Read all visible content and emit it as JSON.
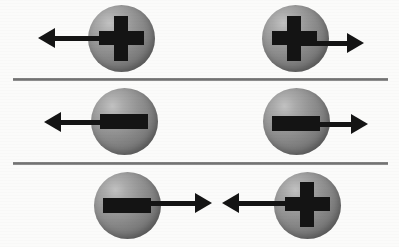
{
  "figure": {
    "background_color": "#fbfbfa",
    "sphere_color": "#848484",
    "sphere_highlight_color": "#c2c2c2",
    "glyph_color": "#141414",
    "arrow_color": "#141414",
    "divider_color": "#7a7a7a",
    "sphere_diameter": 67
  },
  "dividers": [
    {
      "name": "divider-row-1-2",
      "x": 13,
      "y": 78,
      "width": 375
    },
    {
      "name": "divider-row-2-3",
      "x": 13,
      "y": 162,
      "width": 375
    }
  ],
  "rows": [
    {
      "name": "row-positive-diverging",
      "particles": [
        {
          "name": "particle-top-left",
          "charge": "+",
          "charge_label": "positive",
          "arrow_direction": "left",
          "sphere": {
            "cx": 121,
            "cy": 38
          },
          "arrow": {
            "x": 38,
            "y": 38,
            "length": 70
          }
        },
        {
          "name": "particle-top-right",
          "charge": "+",
          "charge_label": "positive",
          "arrow_direction": "right",
          "sphere": {
            "cx": 295,
            "cy": 38
          },
          "arrow": {
            "x": 292,
            "y": 43,
            "length": 72
          }
        }
      ]
    },
    {
      "name": "row-negative-diverging",
      "particles": [
        {
          "name": "particle-middle-left",
          "charge": "-",
          "charge_label": "negative",
          "arrow_direction": "left",
          "sphere": {
            "cx": 124,
            "cy": 121
          },
          "arrow": {
            "x": 44,
            "y": 122,
            "length": 68
          }
        },
        {
          "name": "particle-middle-right",
          "charge": "-",
          "charge_label": "negative",
          "arrow_direction": "right",
          "sphere": {
            "cx": 296,
            "cy": 121
          },
          "arrow": {
            "x": 288,
            "y": 124,
            "length": 80
          }
        }
      ]
    },
    {
      "name": "row-opposite-converging",
      "particles": [
        {
          "name": "particle-bottom-left",
          "charge": "-",
          "charge_label": "negative",
          "arrow_direction": "right",
          "sphere": {
            "cx": 127,
            "cy": 205
          },
          "arrow": {
            "x": 148,
            "y": 203,
            "length": 64
          }
        },
        {
          "name": "particle-bottom-right",
          "charge": "+",
          "charge_label": "positive",
          "arrow_direction": "left",
          "sphere": {
            "cx": 307,
            "cy": 205
          },
          "arrow": {
            "x": 222,
            "y": 203,
            "length": 66
          }
        }
      ]
    }
  ]
}
